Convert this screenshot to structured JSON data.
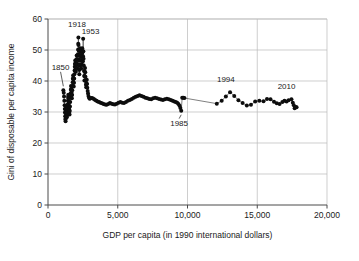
{
  "chart_data": {
    "type": "scatter",
    "title": "",
    "subtitle": "",
    "xlabel": "GDP per capita (in 1990 international dollars)",
    "ylabel": "Gini of disposable per capita income",
    "xlim": [
      0,
      20000
    ],
    "ylim": [
      0,
      60
    ],
    "xticks": [
      0,
      5000,
      10000,
      15000,
      20000
    ],
    "xticklabels": [
      "0",
      "5,000",
      "10,000",
      "15,000",
      "20,000"
    ],
    "yticks": [
      0,
      10,
      20,
      30,
      40,
      50,
      60
    ],
    "yticklabels": [
      "0",
      "10",
      "20",
      "30",
      "40",
      "50",
      "60"
    ],
    "grid": "vertical-and-horizontal",
    "legend": "none",
    "marker": "filled-circle",
    "connected": true,
    "annotations": [
      {
        "label": "1850",
        "x": 1100,
        "y": 37.0,
        "text_x": 900,
        "text_y": 43.6,
        "leader": true
      },
      {
        "label": "1918",
        "x": 2180,
        "y": 54.0,
        "text_x": 2080,
        "text_y": 57.4,
        "leader": false
      },
      {
        "label": "1953",
        "x": 2520,
        "y": 53.6,
        "text_x": 3050,
        "text_y": 55.2,
        "leader": false
      },
      {
        "label": "1985",
        "x": 9550,
        "y": 30.4,
        "text_x": 9400,
        "text_y": 25.6,
        "leader": true
      },
      {
        "label": "1994",
        "x": 13050,
        "y": 36.4,
        "text_x": 12750,
        "text_y": 39.6,
        "leader": false
      },
      {
        "label": "2010",
        "x": 17450,
        "y": 34.1,
        "text_x": 17100,
        "text_y": 37.4,
        "leader": false
      }
    ],
    "series": [
      {
        "name": "Gini of disposable per capita income vs GDP per capita",
        "points": [
          [
            1100,
            37.0
          ],
          [
            1130,
            36.2
          ],
          [
            1150,
            35.0
          ],
          [
            1170,
            33.6
          ],
          [
            1190,
            32.2
          ],
          [
            1205,
            31.0
          ],
          [
            1215,
            29.8
          ],
          [
            1230,
            28.6
          ],
          [
            1245,
            27.6
          ],
          [
            1260,
            27.0
          ],
          [
            1275,
            28.0
          ],
          [
            1290,
            29.4
          ],
          [
            1300,
            30.6
          ],
          [
            1320,
            31.6
          ],
          [
            1335,
            30.2
          ],
          [
            1350,
            29.0
          ],
          [
            1365,
            28.4
          ],
          [
            1380,
            29.6
          ],
          [
            1395,
            31.0
          ],
          [
            1410,
            32.4
          ],
          [
            1425,
            33.6
          ],
          [
            1440,
            34.8
          ],
          [
            1455,
            35.6
          ],
          [
            1470,
            34.4
          ],
          [
            1485,
            33.2
          ],
          [
            1500,
            32.0
          ],
          [
            1515,
            31.0
          ],
          [
            1530,
            30.0
          ],
          [
            1545,
            29.2
          ],
          [
            1560,
            30.4
          ],
          [
            1575,
            31.8
          ],
          [
            1590,
            33.2
          ],
          [
            1605,
            34.6
          ],
          [
            1620,
            36.0
          ],
          [
            1635,
            37.2
          ],
          [
            1650,
            38.4
          ],
          [
            1665,
            37.4
          ],
          [
            1680,
            36.4
          ],
          [
            1695,
            35.4
          ],
          [
            1710,
            34.4
          ],
          [
            1725,
            35.6
          ],
          [
            1740,
            37.0
          ],
          [
            1755,
            38.4
          ],
          [
            1770,
            39.6
          ],
          [
            1785,
            40.8
          ],
          [
            1800,
            41.8
          ],
          [
            1815,
            40.6
          ],
          [
            1830,
            39.4
          ],
          [
            1845,
            38.2
          ],
          [
            1860,
            39.4
          ],
          [
            1875,
            40.8
          ],
          [
            1890,
            42.2
          ],
          [
            1905,
            43.4
          ],
          [
            1920,
            44.6
          ],
          [
            1935,
            45.6
          ],
          [
            1950,
            46.6
          ],
          [
            1965,
            45.4
          ],
          [
            1980,
            44.2
          ],
          [
            1995,
            43.0
          ],
          [
            2010,
            44.2
          ],
          [
            2025,
            45.6
          ],
          [
            2040,
            47.0
          ],
          [
            2055,
            48.2
          ],
          [
            2070,
            46.8
          ],
          [
            2085,
            45.4
          ],
          [
            2100,
            44.0
          ],
          [
            2115,
            45.4
          ],
          [
            2130,
            47.0
          ],
          [
            2145,
            48.6
          ],
          [
            2160,
            50.2
          ],
          [
            2170,
            52.0
          ],
          [
            2180,
            54.0
          ],
          [
            2185,
            51.6
          ],
          [
            2195,
            49.8
          ],
          [
            2205,
            48.2
          ],
          [
            2215,
            46.6
          ],
          [
            2225,
            45.0
          ],
          [
            2235,
            43.6
          ],
          [
            2245,
            42.2
          ],
          [
            2255,
            43.6
          ],
          [
            2265,
            45.2
          ],
          [
            2275,
            46.8
          ],
          [
            2285,
            48.4
          ],
          [
            2295,
            49.8
          ],
          [
            2305,
            50.6
          ],
          [
            2320,
            49.4
          ],
          [
            2335,
            48.0
          ],
          [
            2350,
            46.6
          ],
          [
            2365,
            45.2
          ],
          [
            2380,
            44.0
          ],
          [
            2395,
            45.4
          ],
          [
            2410,
            46.8
          ],
          [
            2425,
            48.2
          ],
          [
            2440,
            49.6
          ],
          [
            2455,
            50.6
          ],
          [
            2470,
            49.2
          ],
          [
            2485,
            47.8
          ],
          [
            2500,
            46.4
          ],
          [
            2510,
            48.0
          ],
          [
            2520,
            53.6
          ],
          [
            2535,
            49.6
          ],
          [
            2550,
            47.2
          ],
          [
            2565,
            45.0
          ],
          [
            2580,
            43.2
          ],
          [
            2595,
            41.6
          ],
          [
            2610,
            40.2
          ],
          [
            2625,
            41.6
          ],
          [
            2640,
            43.0
          ],
          [
            2655,
            44.2
          ],
          [
            2670,
            42.8
          ],
          [
            2685,
            41.4
          ],
          [
            2700,
            40.0
          ],
          [
            2720,
            38.8
          ],
          [
            2740,
            38.0
          ],
          [
            2760,
            39.2
          ],
          [
            2780,
            40.4
          ],
          [
            2800,
            39.0
          ],
          [
            2820,
            37.8
          ],
          [
            2845,
            36.8
          ],
          [
            2870,
            36.0
          ],
          [
            2900,
            35.2
          ],
          [
            2940,
            34.6
          ],
          [
            2990,
            34.3
          ],
          [
            3050,
            34.4
          ],
          [
            3120,
            34.5
          ],
          [
            3200,
            34.4
          ],
          [
            3290,
            34.2
          ],
          [
            3380,
            33.9
          ],
          [
            3470,
            33.6
          ],
          [
            3560,
            33.4
          ],
          [
            3660,
            33.2
          ],
          [
            3760,
            33.0
          ],
          [
            3870,
            32.8
          ],
          [
            3980,
            32.6
          ],
          [
            4090,
            32.4
          ],
          [
            4200,
            32.3
          ],
          [
            4320,
            32.6
          ],
          [
            4440,
            32.9
          ],
          [
            4560,
            32.7
          ],
          [
            4680,
            32.5
          ],
          [
            4800,
            32.4
          ],
          [
            4930,
            32.7
          ],
          [
            5060,
            33.0
          ],
          [
            5190,
            33.2
          ],
          [
            5320,
            33.0
          ],
          [
            5450,
            32.9
          ],
          [
            5590,
            33.2
          ],
          [
            5730,
            33.6
          ],
          [
            5870,
            33.9
          ],
          [
            6010,
            34.2
          ],
          [
            6150,
            34.6
          ],
          [
            6290,
            34.9
          ],
          [
            6430,
            35.2
          ],
          [
            6560,
            35.4
          ],
          [
            6700,
            35.2
          ],
          [
            6840,
            34.9
          ],
          [
            6980,
            34.6
          ],
          [
            7120,
            34.4
          ],
          [
            7260,
            34.2
          ],
          [
            7400,
            34.1
          ],
          [
            7540,
            34.4
          ],
          [
            7680,
            34.6
          ],
          [
            7820,
            34.4
          ],
          [
            7960,
            34.2
          ],
          [
            8100,
            34.0
          ],
          [
            8240,
            33.9
          ],
          [
            8380,
            34.1
          ],
          [
            8520,
            34.3
          ],
          [
            8660,
            34.1
          ],
          [
            8800,
            33.9
          ],
          [
            8930,
            33.6
          ],
          [
            9050,
            33.4
          ],
          [
            9160,
            33.2
          ],
          [
            9260,
            33.0
          ],
          [
            9350,
            32.6
          ],
          [
            9430,
            32.0
          ],
          [
            9490,
            31.3
          ],
          [
            9550,
            30.4
          ],
          [
            9620,
            34.6
          ],
          [
            9700,
            34.6
          ],
          [
            9780,
            34.5
          ],
          [
            12100,
            32.7
          ],
          [
            12450,
            33.6
          ],
          [
            12750,
            35.0
          ],
          [
            13050,
            36.4
          ],
          [
            13350,
            35.2
          ],
          [
            13650,
            33.8
          ],
          [
            13950,
            32.9
          ],
          [
            14250,
            32.1
          ],
          [
            14550,
            32.3
          ],
          [
            14850,
            33.4
          ],
          [
            15150,
            33.6
          ],
          [
            15450,
            33.5
          ],
          [
            15700,
            34.2
          ],
          [
            15950,
            34.1
          ],
          [
            16200,
            33.3
          ],
          [
            16400,
            32.8
          ],
          [
            16600,
            32.6
          ],
          [
            16800,
            33.2
          ],
          [
            16950,
            33.6
          ],
          [
            17100,
            33.4
          ],
          [
            17250,
            33.8
          ],
          [
            17450,
            34.1
          ],
          [
            17550,
            33.0
          ],
          [
            17620,
            32.2
          ],
          [
            17680,
            31.2
          ],
          [
            17760,
            31.6
          ],
          [
            17820,
            31.5
          ]
        ]
      }
    ]
  }
}
